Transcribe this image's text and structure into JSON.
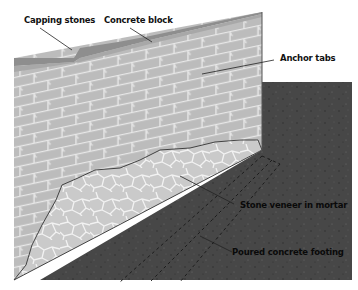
{
  "diagram": {
    "labels": {
      "capping_stones": "Capping stones",
      "concrete_block": "Concrete block",
      "anchor_tabs": "Anchor tabs",
      "stone_veneer": "Stone veneer in mortar",
      "footing": "Poured concrete footing"
    },
    "colors": {
      "wall": "#bdbdbd",
      "mortar_lines": "#e6e6e6",
      "capping": "#8f8f8f",
      "footing": "#4a4a4a",
      "stone": "#cfcfcf",
      "background": "#ffffff"
    }
  }
}
